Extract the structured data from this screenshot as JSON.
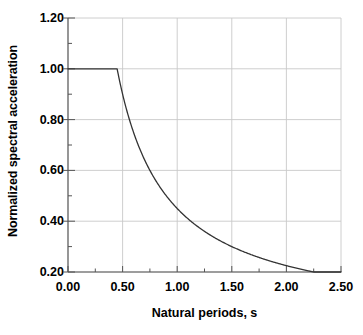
{
  "chart_data": {
    "type": "line",
    "title": "",
    "xlabel": "Natural periods, s",
    "ylabel": "Normalized spectral acceleration",
    "xlim": [
      0.0,
      2.5
    ],
    "ylim": [
      0.2,
      1.2
    ],
    "grid": true,
    "legend": null,
    "xticks": [
      "0.00",
      "0.50",
      "1.00",
      "1.50",
      "2.00",
      "2.50"
    ],
    "xtick_values": [
      0.0,
      0.5,
      1.0,
      1.5,
      2.0,
      2.5
    ],
    "xminor_values": [
      0.25,
      0.75,
      1.25,
      1.75,
      2.25
    ],
    "yticks": [
      "0.20",
      "0.40",
      "0.60",
      "0.80",
      "1.00",
      "1.20"
    ],
    "ytick_values": [
      0.2,
      0.4,
      0.6,
      0.8,
      1.0,
      1.2
    ],
    "yminor_values": [
      0.3,
      0.5,
      0.7,
      0.9,
      1.1
    ],
    "series": [
      {
        "name": "Normalized design spectrum",
        "corner_period": 0.45,
        "plateau_value": 1.0,
        "decay": "Sa = 0.45 / T for T > 0.45 s",
        "x": [
          0.0,
          0.05,
          0.1,
          0.15,
          0.2,
          0.25,
          0.3,
          0.35,
          0.4,
          0.45,
          0.5,
          0.55,
          0.6,
          0.65,
          0.7,
          0.75,
          0.8,
          0.85,
          0.9,
          0.95,
          1.0,
          1.1,
          1.2,
          1.3,
          1.4,
          1.5,
          1.6,
          1.7,
          1.8,
          1.9,
          2.0,
          2.1,
          2.2,
          2.3,
          2.4,
          2.5
        ],
        "y": [
          1.0,
          1.0,
          1.0,
          1.0,
          1.0,
          1.0,
          1.0,
          1.0,
          1.0,
          1.0,
          0.9,
          0.82,
          0.75,
          0.69,
          0.64,
          0.6,
          0.56,
          0.53,
          0.5,
          0.47,
          0.45,
          0.41,
          0.38,
          0.35,
          0.32,
          0.3,
          0.28,
          0.26,
          0.25,
          0.24,
          0.23,
          0.21,
          0.2,
          0.2,
          0.19,
          0.18
        ]
      }
    ],
    "colors": {
      "curve": "#333333",
      "grid": "#c8c8c8",
      "axis": "#555555",
      "background": "#ffffff",
      "text": "#000000"
    }
  }
}
